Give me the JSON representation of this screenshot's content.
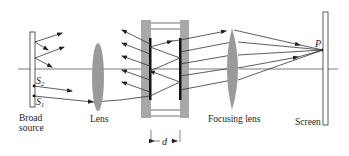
{
  "labels": {
    "broad_source_line1": "Broad",
    "broad_source_line2": "source",
    "lens": "Lens",
    "focusing_lens": "Focusing lens",
    "screen": "Screen",
    "point_p": "P",
    "s1": "S",
    "s1_sub": "1",
    "s2": "S",
    "s2_sub": "2",
    "separation": "d"
  },
  "colors": {
    "lens_fill": "#9a9a9a",
    "plate_fill": "#a8a8a8",
    "coating": "#111111",
    "ray": "#333333"
  }
}
